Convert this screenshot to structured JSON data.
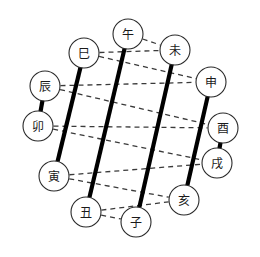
{
  "figure": {
    "title": "",
    "background": "#ffffff",
    "width": 260,
    "height": 257,
    "node_fill": "#ffffff",
    "node_stroke": "#2a2a2a",
    "thick_line_color": "#000000",
    "dashed_line_color": "#3a3a3a"
  },
  "nodes": [
    {
      "id": "wu",
      "label": "午",
      "cx": 128,
      "cy": 34
    },
    {
      "id": "wei",
      "label": "未",
      "cx": 175,
      "cy": 50
    },
    {
      "id": "si",
      "label": "巳",
      "cx": 84,
      "cy": 53
    },
    {
      "id": "shen",
      "label": "申",
      "cx": 211,
      "cy": 82
    },
    {
      "id": "chen",
      "label": "辰",
      "cx": 45,
      "cy": 86
    },
    {
      "id": "you",
      "label": "酉",
      "cx": 223,
      "cy": 128
    },
    {
      "id": "mao",
      "label": "卯",
      "cx": 38,
      "cy": 126
    },
    {
      "id": "xu",
      "label": "戌",
      "cx": 217,
      "cy": 163
    },
    {
      "id": "yin",
      "label": "寅",
      "cx": 54,
      "cy": 176
    },
    {
      "id": "hai",
      "label": "亥",
      "cx": 184,
      "cy": 200
    },
    {
      "id": "chou",
      "label": "丑",
      "cx": 86,
      "cy": 212
    },
    {
      "id": "zi",
      "label": "子",
      "cx": 136,
      "cy": 222
    }
  ],
  "node_radius": 15,
  "thick_edges": [
    {
      "from": "si",
      "to": "yin"
    },
    {
      "from": "wu",
      "to": "chou"
    },
    {
      "from": "wei",
      "to": "zi"
    },
    {
      "from": "shen",
      "to": "hai"
    },
    {
      "from": "chen",
      "to": "mao"
    },
    {
      "from": "you",
      "to": "xu"
    }
  ],
  "dashed_edges": [
    {
      "from": "wu",
      "to": "wei"
    },
    {
      "from": "si",
      "to": "wei"
    },
    {
      "from": "si",
      "to": "shen"
    },
    {
      "from": "chen",
      "to": "shen"
    },
    {
      "from": "chen",
      "to": "you"
    },
    {
      "from": "mao",
      "to": "you"
    },
    {
      "from": "mao",
      "to": "xu"
    },
    {
      "from": "yin",
      "to": "xu"
    },
    {
      "from": "yin",
      "to": "hai"
    },
    {
      "from": "chou",
      "to": "hai"
    },
    {
      "from": "chou",
      "to": "zi"
    }
  ],
  "chart_data": {
    "type": "diagram",
    "title": "",
    "subtitle": "",
    "diagram_kind": "earthly-branches-pairing-circle",
    "node_count": 12,
    "nodes": [
      "午",
      "未",
      "巳",
      "申",
      "辰",
      "酉",
      "卯",
      "戌",
      "寅",
      "亥",
      "丑",
      "子"
    ],
    "solid_pairs": [
      [
        "巳",
        "寅"
      ],
      [
        "午",
        "丑"
      ],
      [
        "未",
        "子"
      ],
      [
        "申",
        "亥"
      ],
      [
        "辰",
        "卯"
      ],
      [
        "酉",
        "戌"
      ]
    ],
    "dashed_pairs": [
      [
        "午",
        "未"
      ],
      [
        "巳",
        "未"
      ],
      [
        "巳",
        "申"
      ],
      [
        "辰",
        "申"
      ],
      [
        "辰",
        "酉"
      ],
      [
        "卯",
        "酉"
      ],
      [
        "卯",
        "戌"
      ],
      [
        "寅",
        "戌"
      ],
      [
        "寅",
        "亥"
      ],
      [
        "丑",
        "亥"
      ],
      [
        "丑",
        "子"
      ]
    ],
    "legend": [],
    "annotations": [],
    "grid": false
  }
}
